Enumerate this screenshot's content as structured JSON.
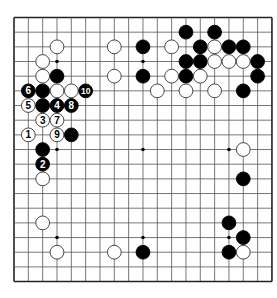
{
  "diagram": {
    "type": "go-board",
    "size": 19,
    "geometry": {
      "x0": 14,
      "y0": 17.5,
      "dx": 14.33,
      "dy": 14.67,
      "stone_r": 6.9
    },
    "colors": {
      "background": "#ffffff",
      "line": "#555555",
      "border": "#222222",
      "black_stone": "#000000",
      "white_stone": "#ffffff",
      "white_stroke": "#333333"
    },
    "star_points": [
      [
        3,
        3
      ],
      [
        9,
        3
      ],
      [
        15,
        3
      ],
      [
        3,
        9
      ],
      [
        9,
        9
      ],
      [
        15,
        9
      ],
      [
        3,
        15
      ],
      [
        9,
        15
      ],
      [
        15,
        15
      ]
    ],
    "stones": [
      {
        "color": "black",
        "col": 12,
        "row": 1
      },
      {
        "color": "black",
        "col": 14,
        "row": 1
      },
      {
        "color": "white",
        "col": 3,
        "row": 2
      },
      {
        "color": "white",
        "col": 7,
        "row": 2
      },
      {
        "color": "black",
        "col": 9,
        "row": 2
      },
      {
        "color": "white",
        "col": 11,
        "row": 2
      },
      {
        "color": "black",
        "col": 13,
        "row": 2
      },
      {
        "color": "white",
        "col": 14,
        "row": 2
      },
      {
        "color": "black",
        "col": 15,
        "row": 2
      },
      {
        "color": "black",
        "col": 16,
        "row": 2
      },
      {
        "color": "white",
        "col": 2,
        "row": 3
      },
      {
        "color": "black",
        "col": 12,
        "row": 3
      },
      {
        "color": "black",
        "col": 13,
        "row": 3
      },
      {
        "color": "white",
        "col": 14,
        "row": 3
      },
      {
        "color": "white",
        "col": 15,
        "row": 3
      },
      {
        "color": "white",
        "col": 16,
        "row": 3
      },
      {
        "color": "black",
        "col": 17,
        "row": 3
      },
      {
        "color": "white",
        "col": 2,
        "row": 4
      },
      {
        "color": "black",
        "col": 3,
        "row": 4
      },
      {
        "color": "white",
        "col": 7,
        "row": 4
      },
      {
        "color": "black",
        "col": 9,
        "row": 4
      },
      {
        "color": "white",
        "col": 11,
        "row": 4
      },
      {
        "color": "black",
        "col": 12,
        "row": 4
      },
      {
        "color": "white",
        "col": 13,
        "row": 4
      },
      {
        "color": "black",
        "col": 17,
        "row": 4
      },
      {
        "color": "black",
        "col": 1,
        "row": 5,
        "label": "6"
      },
      {
        "color": "black",
        "col": 2,
        "row": 5
      },
      {
        "color": "white",
        "col": 3,
        "row": 5
      },
      {
        "color": "white",
        "col": 4,
        "row": 5
      },
      {
        "color": "black",
        "col": 5,
        "row": 5,
        "label": "10"
      },
      {
        "color": "white",
        "col": 10,
        "row": 5
      },
      {
        "color": "white",
        "col": 12,
        "row": 5
      },
      {
        "color": "white",
        "col": 14,
        "row": 5
      },
      {
        "color": "black",
        "col": 16,
        "row": 5
      },
      {
        "color": "white",
        "col": 1,
        "row": 6,
        "label": "5"
      },
      {
        "color": "black",
        "col": 2,
        "row": 6
      },
      {
        "color": "black",
        "col": 3,
        "row": 6,
        "label": "4"
      },
      {
        "color": "black",
        "col": 4,
        "row": 6,
        "label": "8"
      },
      {
        "color": "white",
        "col": 2,
        "row": 7,
        "label": "3"
      },
      {
        "color": "white",
        "col": 3,
        "row": 7,
        "label": "7"
      },
      {
        "color": "white",
        "col": 1,
        "row": 8,
        "label": "1"
      },
      {
        "color": "white",
        "col": 3,
        "row": 8,
        "label": "9"
      },
      {
        "color": "black",
        "col": 4,
        "row": 8
      },
      {
        "color": "black",
        "col": 2,
        "row": 9
      },
      {
        "color": "white",
        "col": 16,
        "row": 9
      },
      {
        "color": "black",
        "col": 2,
        "row": 10,
        "label": "2"
      },
      {
        "color": "white",
        "col": 2,
        "row": 11
      },
      {
        "color": "black",
        "col": 16,
        "row": 11
      },
      {
        "color": "white",
        "col": 2,
        "row": 14
      },
      {
        "color": "black",
        "col": 15,
        "row": 14
      },
      {
        "color": "black",
        "col": 16,
        "row": 15
      },
      {
        "color": "white",
        "col": 3,
        "row": 16
      },
      {
        "color": "white",
        "col": 7,
        "row": 16
      },
      {
        "color": "black",
        "col": 9,
        "row": 16
      },
      {
        "color": "black",
        "col": 15,
        "row": 16
      },
      {
        "color": "white",
        "col": 16,
        "row": 16
      }
    ]
  }
}
